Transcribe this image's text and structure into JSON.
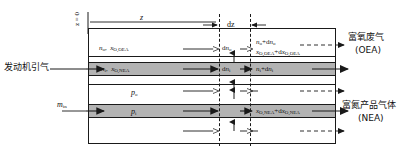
{
  "figure": {
    "type": "schematic-diagram",
    "background_color": "#ffffff",
    "line_color": "#1a1a1a",
    "band_color": "#b3b3b3"
  },
  "axis": {
    "origin_label": "z = 0",
    "length_label": "z",
    "element_label": "dz"
  },
  "inlet_labels": {
    "engine_bleed": "发动机引气",
    "mass_flow": "m_in",
    "mass_flow_base": "m",
    "mass_flow_sub": "in"
  },
  "outlet_labels": {
    "oea_cn": "富氧废气",
    "oea_en": "(OEA)",
    "nea_cn": "富氮产品气体",
    "nea_en": "(NEA)"
  },
  "stream_labels": {
    "shell_in_n": "n_o",
    "shell_in_x": "x_O,OEA",
    "bore_in_n": "n_i",
    "bore_in_x": "x_O,NEA",
    "shell_out_n": "n_o+dn_o",
    "shell_out_x": "x_O,OEA+dx_O,OEA",
    "bore_out_n": "n_i+dn_i",
    "bore_out_x": "x_O,NEA+dx_O,NEA",
    "permeate_shell": "dn_o",
    "permeate_bore": "dn_i",
    "pressure_outer": "p_o",
    "pressure_inner": "p_i"
  },
  "symbols": {
    "n_base": "n",
    "x_base": "x",
    "p_base": "p",
    "d_prefix": "d",
    "sub_o": "o",
    "sub_i": "i",
    "sub_O_OEA": "O,OEA",
    "sub_O_NEA": "O,NEA"
  },
  "icons": {
    "solid_arrow": "solid-arrow-right-icon",
    "open_arrow": "open-arrow-right-icon",
    "dashed_arrow": "dashed-arrow-right-icon",
    "up_arrow": "arrow-up-icon",
    "down_arrow": "arrow-down-icon",
    "dim_arrow": "dimension-arrow-icon"
  }
}
